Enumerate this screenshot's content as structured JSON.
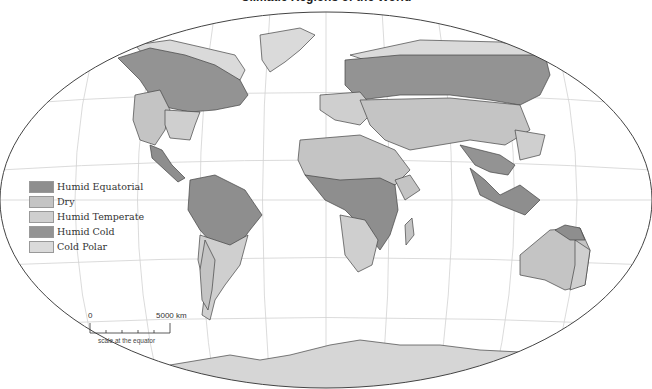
{
  "title": "Climatic Regions of the World",
  "legend": {
    "items": [
      {
        "label": "Humid Equatorial",
        "color": "#8e8e8e"
      },
      {
        "label": "Dry",
        "color": "#c4c4c4"
      },
      {
        "label": "Humid Temperate",
        "color": "#cfcfcf"
      },
      {
        "label": "Humid Cold",
        "color": "#939393"
      },
      {
        "label": "Cold Polar",
        "color": "#dadada"
      }
    ]
  },
  "scale": {
    "zero": "0",
    "max": "5000 km",
    "caption": "scale at the equator"
  },
  "colors": {
    "ocean": "#ffffff",
    "graticule": "#cfcfcf",
    "border": "#444444",
    "antarctica": "#d6d6d6"
  }
}
